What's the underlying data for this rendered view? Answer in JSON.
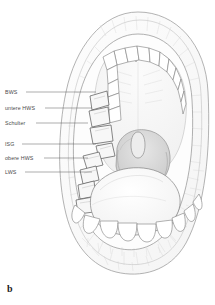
{
  "figure": {
    "caption_letter": "b",
    "style": "pencil-line-drawing",
    "background_color": "#ffffff",
    "line_color": "#6e6e6e",
    "label_color": "#4a4a4a"
  },
  "labels": [
    {
      "id": "bws",
      "text": "BWS",
      "text_x": 5,
      "text_y": 89,
      "line_y": 92,
      "line_x1": 26,
      "line_x2": 96
    },
    {
      "id": "untere-hws",
      "text": "untere HWS",
      "text_x": 5,
      "text_y": 105,
      "line_y": 108,
      "line_x1": 45,
      "line_x2": 92
    },
    {
      "id": "schulter",
      "text": "Schulter",
      "text_x": 5,
      "text_y": 120,
      "line_y": 123,
      "line_x1": 36,
      "line_x2": 88
    },
    {
      "id": "isg",
      "text": "ISG",
      "text_x": 5,
      "text_y": 141,
      "line_y": 144,
      "line_x1": 22,
      "line_x2": 96
    },
    {
      "id": "obere-hws",
      "text": "obere HWS",
      "text_x": 5,
      "text_y": 155,
      "line_y": 158,
      "line_x1": 44,
      "line_x2": 88
    },
    {
      "id": "lws",
      "text": "LWS",
      "text_x": 5,
      "text_y": 169,
      "line_y": 172,
      "line_x1": 25,
      "line_x2": 92
    }
  ],
  "anatomy_parts": [
    {
      "id": "outer-lip-ring",
      "name": "outer lip outline"
    },
    {
      "id": "inner-lip-ring",
      "name": "inner lip margin"
    },
    {
      "id": "upper-dental-arch",
      "name": "upper teeth arch"
    },
    {
      "id": "lower-dental-arch",
      "name": "lower teeth arch"
    },
    {
      "id": "hard-palate",
      "name": "hard palate"
    },
    {
      "id": "uvula",
      "name": "uvula"
    },
    {
      "id": "oropharynx",
      "name": "throat opening"
    },
    {
      "id": "tongue",
      "name": "tongue"
    },
    {
      "id": "highlighted-teeth-upper-left",
      "name": "labelled upper left molars"
    },
    {
      "id": "highlighted-teeth-lower-left",
      "name": "labelled lower left molars"
    }
  ]
}
